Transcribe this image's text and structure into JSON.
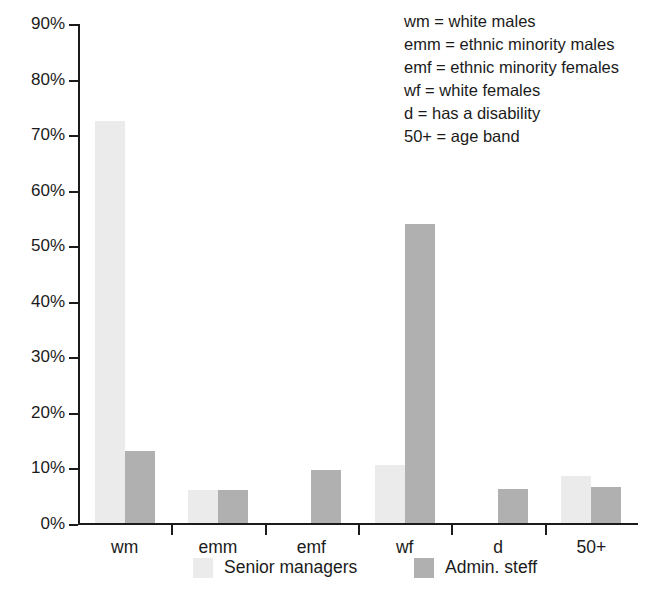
{
  "chart_data": {
    "type": "bar",
    "title": "",
    "xlabel": "",
    "ylabel": "",
    "ylim": [
      0,
      90
    ],
    "ytick_labels": [
      "0%",
      "10%",
      "20%",
      "30%",
      "40%",
      "50%",
      "60%",
      "70%",
      "80%",
      "90%"
    ],
    "ytick_values": [
      0,
      10,
      20,
      30,
      40,
      50,
      60,
      70,
      80,
      90
    ],
    "grid": false,
    "legend_position": "bottom",
    "categories": [
      "wm",
      "emm",
      "emf",
      "wf",
      "d",
      "50+"
    ],
    "series": [
      {
        "name": "Senior managers",
        "color": "#ebebeb",
        "values": [
          72.4,
          6.0,
          null,
          10.4,
          null,
          8.5
        ]
      },
      {
        "name": "Admin. steff",
        "color": "#b0b0b0",
        "values": [
          13.0,
          6.0,
          9.5,
          53.9,
          6.2,
          6.4
        ]
      }
    ],
    "annotations": [
      "wm = white males",
      "emm = ethnic minority males",
      "emf = ethnic minority females",
      "wf = white females",
      "d = has a disability",
      "50+ = age band"
    ]
  },
  "abbreviation_key": [
    "wm = white males",
    "emm = ethnic minority males",
    "emf = ethnic minority females",
    "wf = white females",
    "d = has a disability",
    "50+ = age band"
  ]
}
